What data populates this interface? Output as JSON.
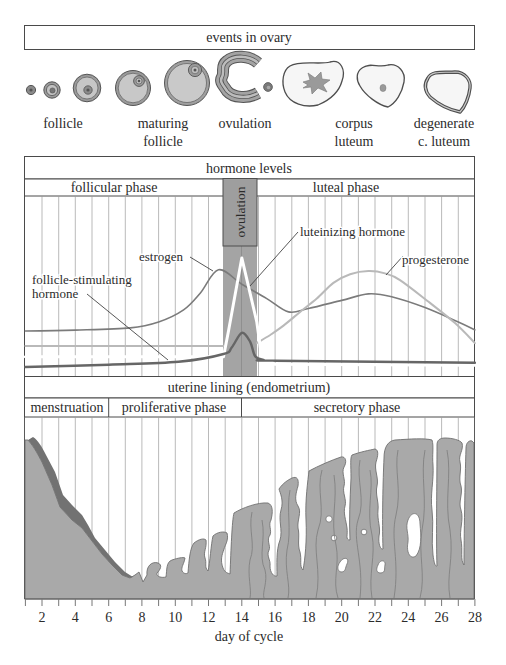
{
  "ovary": {
    "title": "events in ovary",
    "stages": [
      {
        "lines": [
          "follicle"
        ]
      },
      {
        "lines": [
          "maturing",
          "follicle"
        ]
      },
      {
        "lines": [
          "ovulation"
        ]
      },
      {
        "lines": [
          "corpus",
          "luteum"
        ]
      },
      {
        "lines": [
          "degenerate",
          "c. luteum"
        ]
      }
    ]
  },
  "hormones": {
    "title": "hormone levels",
    "phases": {
      "follicular": "follicular phase",
      "ovulation": "ovulation",
      "luteal": "luteal phase"
    },
    "labels": {
      "estrogen": "estrogen",
      "lh": "luteinizing hormone",
      "fsh_line1": "follicle-stimulating",
      "fsh_line2": "hormone",
      "progesterone": "progesterone"
    },
    "ovulation_days": [
      13,
      15
    ],
    "curves": [
      {
        "name": "estrogen",
        "color": "#7b7b7b",
        "width": 1.6,
        "smooth": true,
        "points": [
          [
            1,
            25
          ],
          [
            4,
            25.5
          ],
          [
            7.3,
            26.7
          ],
          [
            9,
            30
          ],
          [
            10.5,
            36.7
          ],
          [
            11.5,
            46
          ],
          [
            12.6,
            59
          ],
          [
            14,
            51
          ],
          [
            15.5,
            43
          ],
          [
            16.8,
            35.6
          ],
          [
            18,
            37.5
          ],
          [
            20,
            42
          ],
          [
            21.6,
            45.6
          ],
          [
            23,
            44
          ],
          [
            25,
            38
          ],
          [
            27,
            30
          ],
          [
            28,
            25.6
          ]
        ]
      },
      {
        "name": "progesterone-early",
        "color": "#b9b9b9",
        "width": 2,
        "smooth": false,
        "points": [
          [
            1,
            16.7
          ],
          [
            12.95,
            16.7
          ]
        ]
      },
      {
        "name": "progesterone",
        "color": "#b9b9b9",
        "width": 2,
        "smooth": true,
        "points": [
          [
            14.9,
            18.3
          ],
          [
            15.7,
            22.8
          ],
          [
            16.5,
            28
          ],
          [
            17.5,
            35.6
          ],
          [
            18.5,
            43
          ],
          [
            19.5,
            51.7
          ],
          [
            20.5,
            56.5
          ],
          [
            21.6,
            58.3
          ],
          [
            22.6,
            57
          ],
          [
            23.5,
            53.3
          ],
          [
            25.3,
            40.6
          ],
          [
            26.8,
            29.4
          ],
          [
            28,
            18.3
          ]
        ]
      },
      {
        "name": "luteinizing-hormone",
        "color": "#ffffff",
        "width": 3,
        "smooth": false,
        "points": [
          [
            1,
            10.7
          ],
          [
            12.9,
            10.7
          ],
          [
            13.2,
            25
          ],
          [
            14,
            65.6
          ],
          [
            14.9,
            30
          ],
          [
            15.2,
            10
          ],
          [
            16,
            6.5
          ],
          [
            28,
            6
          ]
        ]
      },
      {
        "name": "follicle-stimulating-hormone",
        "color": "#666666",
        "width": 2.4,
        "smooth": true,
        "points": [
          [
            1,
            5
          ],
          [
            6,
            6.3
          ],
          [
            10.2,
            7.9
          ],
          [
            12.9,
            12.2
          ],
          [
            13.4,
            16
          ],
          [
            14,
            24
          ],
          [
            14.5,
            19
          ],
          [
            14.8,
            11
          ],
          [
            15.3,
            9
          ],
          [
            16,
            8.5
          ],
          [
            28,
            7.4
          ]
        ]
      }
    ]
  },
  "uterus": {
    "title": "uterine lining (endometrium)",
    "phases": {
      "menstruation": "menstruation",
      "proliferative": "proliferative phase",
      "secretory": "secretory phase"
    },
    "colors": {
      "tissue": "#a9a9a9",
      "shedding": "#727272",
      "outline": "#707070"
    }
  },
  "axis": {
    "label": "day of cycle",
    "day_min": 1,
    "day_max": 28,
    "ticks": [
      "2",
      "4",
      "6",
      "8",
      "10",
      "12",
      "14",
      "16",
      "18",
      "20",
      "22",
      "24",
      "26",
      "28"
    ]
  }
}
